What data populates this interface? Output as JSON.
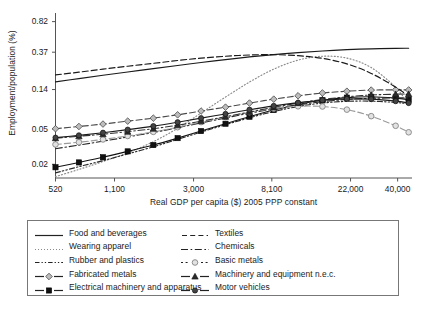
{
  "chart_data": {
    "type": "line",
    "title": "",
    "xlabel": "Real GDP per capita ($) 2005 PPP constant",
    "ylabel": "Employment/population (%)",
    "xscale": "log",
    "yscale": "log",
    "xlim": [
      520,
      48000
    ],
    "ylim": [
      0.014,
      1.0
    ],
    "xticks": [
      520,
      1100,
      3000,
      8100,
      22000,
      40000
    ],
    "xticklabels": [
      "520",
      "1,100",
      "3,000",
      "8,100",
      "22,000",
      "40,000"
    ],
    "yticks": [
      0.02,
      0.05,
      0.14,
      0.37,
      0.82
    ],
    "yticklabels": [
      "0.02",
      "0.05",
      "0.14",
      "0.37",
      "0.82"
    ],
    "grid": false,
    "legend_position": "below",
    "x": [
      520,
      700,
      950,
      1300,
      1800,
      2450,
      3300,
      4500,
      6100,
      8300,
      11300,
      15400,
      21000,
      28600,
      39000,
      46000
    ],
    "series": [
      {
        "name": "Food and beverages",
        "style": "solid",
        "marker": "none",
        "color": "#1a1a1a",
        "values": [
          0.171,
          0.186,
          0.203,
          0.221,
          0.241,
          0.262,
          0.283,
          0.305,
          0.327,
          0.347,
          0.366,
          0.382,
          0.395,
          0.404,
          0.409,
          0.41
        ]
      },
      {
        "name": "Wearing apparel",
        "style": "dotted",
        "marker": "none",
        "color": "#8a8a8a",
        "values": [
          0.0145,
          0.0175,
          0.0215,
          0.027,
          0.036,
          0.051,
          0.076,
          0.115,
          0.17,
          0.238,
          0.301,
          0.333,
          0.317,
          0.248,
          0.148,
          0.095
        ]
      },
      {
        "name": "Rubber and plastics",
        "style": "dashdotdot",
        "marker": "none",
        "color": "#2a2a2a",
        "values": [
          0.016,
          0.0188,
          0.022,
          0.0262,
          0.0315,
          0.0383,
          0.0463,
          0.056,
          0.0672,
          0.079,
          0.09,
          0.0985,
          0.103,
          0.1035,
          0.1,
          0.0965
        ]
      },
      {
        "name": "Fabricated metals",
        "style": "dashed",
        "marker": "diamond",
        "color": "#4a4a4a",
        "values": [
          0.0505,
          0.0535,
          0.057,
          0.0615,
          0.0665,
          0.0725,
          0.08,
          0.0885,
          0.0985,
          0.109,
          0.119,
          0.128,
          0.134,
          0.138,
          0.139,
          0.1385
        ]
      },
      {
        "name": "Electrical machinery and apparatus",
        "style": "solid",
        "marker": "square",
        "color": "#111111",
        "values": [
          0.0185,
          0.021,
          0.024,
          0.028,
          0.033,
          0.0395,
          0.0475,
          0.0575,
          0.069,
          0.082,
          0.095,
          0.106,
          0.1135,
          0.116,
          0.112,
          0.1075
        ]
      },
      {
        "name": "Textiles",
        "style": "dashed",
        "marker": "none",
        "color": "#1a1a1a",
        "values": [
          0.205,
          0.22,
          0.238,
          0.257,
          0.277,
          0.298,
          0.317,
          0.333,
          0.344,
          0.347,
          0.338,
          0.315,
          0.273,
          0.213,
          0.149,
          0.118
        ]
      },
      {
        "name": "Chemicals",
        "style": "dashdot",
        "marker": "none",
        "color": "#2a2a2a",
        "values": [
          0.03,
          0.033,
          0.0365,
          0.0408,
          0.0458,
          0.0518,
          0.0588,
          0.0668,
          0.0757,
          0.085,
          0.094,
          0.102,
          0.108,
          0.1115,
          0.1125,
          0.1125
        ]
      },
      {
        "name": "Basic metals",
        "style": "dashed",
        "marker": "circle-open",
        "color": "#9a9a9a",
        "values": [
          0.0335,
          0.0355,
          0.0382,
          0.0418,
          0.0465,
          0.0525,
          0.06,
          0.0685,
          0.0775,
          0.0855,
          0.0905,
          0.09,
          0.083,
          0.07,
          0.0545,
          0.046
        ]
      },
      {
        "name": "Machinery and equipment n.e.c.",
        "style": "dashdot",
        "marker": "triangle",
        "color": "#333333",
        "values": [
          0.0395,
          0.0415,
          0.0438,
          0.0468,
          0.0505,
          0.0553,
          0.0615,
          0.069,
          0.078,
          0.088,
          0.0985,
          0.108,
          0.116,
          0.1215,
          0.124,
          0.1245
        ]
      },
      {
        "name": "Motor vehicles",
        "style": "solid",
        "marker": "dot",
        "color": "#1a1a1a",
        "values": [
          0.04,
          0.0425,
          0.0455,
          0.0493,
          0.054,
          0.0598,
          0.0665,
          0.0742,
          0.0828,
          0.0915,
          0.0995,
          0.106,
          0.1095,
          0.109,
          0.1035,
          0.0985
        ]
      }
    ]
  },
  "legend": {
    "entries": [
      {
        "label": "Food and beverages",
        "key": "solid-line-key"
      },
      {
        "label": "Textiles",
        "key": "dashed-line-key"
      },
      {
        "label": "Wearing apparel",
        "key": "dotted-line-key"
      },
      {
        "label": "Chemicals",
        "key": "dashdot-line-key"
      },
      {
        "label": "Rubber and plastics",
        "key": "dashdotdot-line-key"
      },
      {
        "label": "Basic metals",
        "key": "circle-marker-key"
      },
      {
        "label": "Fabricated metals",
        "key": "diamond-marker-key"
      },
      {
        "label": "Machinery and equipment n.e.c.",
        "key": "triangle-marker-key"
      },
      {
        "label": "Electrical machinery and apparatus",
        "key": "square-marker-key"
      },
      {
        "label": "Motor vehicles",
        "key": "dot-marker-key"
      }
    ]
  }
}
